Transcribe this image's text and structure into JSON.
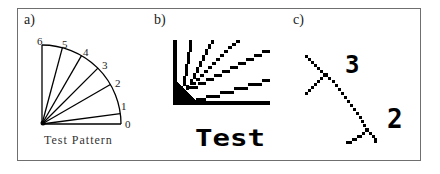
{
  "panels": [
    {
      "id": "a",
      "label": "a)",
      "caption": "Test Pattern",
      "angle_labels": [
        "0",
        "1",
        "2",
        "3",
        "4",
        "5",
        "6"
      ]
    },
    {
      "id": "b",
      "label": "b)",
      "caption": "Test"
    },
    {
      "id": "c",
      "label": "c)",
      "markers": [
        "3",
        "2"
      ]
    }
  ],
  "colors": {
    "ink": "#000000",
    "frame": "#6f6f6f",
    "background": "#ffffff"
  }
}
